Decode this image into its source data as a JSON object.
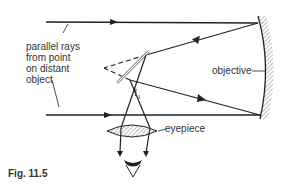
{
  "diagram": {
    "type": "newtonian-reflecting-telescope",
    "caption": "Fig. 11.5",
    "labels": {
      "rays_line1": "parallel rays",
      "rays_line2": "from point",
      "rays_line3": "on distant",
      "rays_line4": "object",
      "objective": "objective",
      "eyepiece": "eyepiece",
      "image": "I",
      "image_subscript": "1"
    },
    "colors": {
      "line": "#222222",
      "mirror": "#999999",
      "hatch": "#777777",
      "background": "#ffffff"
    }
  }
}
